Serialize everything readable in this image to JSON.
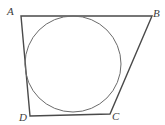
{
  "figure": {
    "background_color": "#ffffff",
    "stroke_color": "#4a4a4a",
    "circle_stroke_color": "#6b6b6b",
    "label_color": "#3c3c3c",
    "labels": {
      "a": "A",
      "b": "B",
      "c": "C",
      "d": "D"
    },
    "vertices": {
      "a": {
        "x": 21,
        "y": 16
      },
      "b": {
        "x": 152,
        "y": 16
      },
      "c": {
        "x": 110,
        "y": 114
      },
      "d": {
        "x": 30,
        "y": 116
      }
    },
    "incircle": {
      "center_x": 73,
      "center_y": 64,
      "radius": 48
    },
    "polygon_points": "21,16 152,16 110,114 30,116",
    "stroke_width": 1.4,
    "circle_stroke_width": 1
  }
}
